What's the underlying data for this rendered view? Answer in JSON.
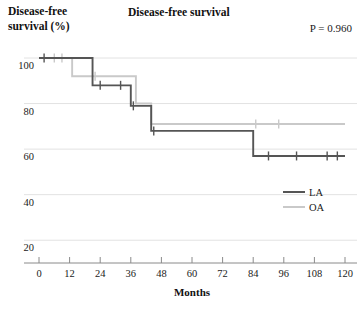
{
  "chart_data": {
    "type": "line",
    "title": "Disease-free survival",
    "subtitle": "",
    "ylabel_line1": "Disease-free",
    "ylabel_line2": "survival (%)",
    "xlabel": "Months",
    "annotation": "P = 0.960",
    "xlim": [
      -4,
      122
    ],
    "ylim": [
      10,
      104
    ],
    "xticks": [
      0,
      12,
      24,
      36,
      48,
      60,
      72,
      84,
      96,
      108,
      120
    ],
    "xtick_labels": [
      "0",
      "12",
      "24",
      "36",
      "48",
      "60",
      "72",
      "84",
      "96",
      "108",
      "120"
    ],
    "yticks": [
      100,
      80,
      60,
      40,
      20
    ],
    "ytick_labels": [
      "100",
      "80",
      "60",
      "40",
      "20"
    ],
    "grid": "horizontal",
    "legend_position": "right-middle",
    "colors": {
      "LA": "#555555",
      "OA": "#c9c9c9",
      "grid": "#e2e2e2",
      "axis": "#8a8a8a",
      "text": "#1a1a1a"
    },
    "series": [
      {
        "name": "LA",
        "label": "LA",
        "color": "#555555",
        "style": "step",
        "steps": [
          {
            "x": 0,
            "y": 100
          },
          {
            "x": 21,
            "y": 100
          },
          {
            "x": 21,
            "y": 88
          },
          {
            "x": 36,
            "y": 88
          },
          {
            "x": 36,
            "y": 79
          },
          {
            "x": 44,
            "y": 79
          },
          {
            "x": 44,
            "y": 68
          },
          {
            "x": 84,
            "y": 68
          },
          {
            "x": 84,
            "y": 57
          },
          {
            "x": 120,
            "y": 57
          }
        ],
        "censored": [
          {
            "x": 2,
            "y": 100
          },
          {
            "x": 24,
            "y": 88
          },
          {
            "x": 32,
            "y": 88
          },
          {
            "x": 37,
            "y": 79
          },
          {
            "x": 45,
            "y": 68
          },
          {
            "x": 90,
            "y": 57
          },
          {
            "x": 101,
            "y": 57
          },
          {
            "x": 113,
            "y": 57
          },
          {
            "x": 117,
            "y": 57
          }
        ]
      },
      {
        "name": "OA",
        "label": "OA",
        "color": "#c9c9c9",
        "style": "step",
        "steps": [
          {
            "x": 0,
            "y": 100
          },
          {
            "x": 13,
            "y": 100
          },
          {
            "x": 13,
            "y": 92
          },
          {
            "x": 38,
            "y": 92
          },
          {
            "x": 38,
            "y": 80
          },
          {
            "x": 44,
            "y": 80
          },
          {
            "x": 44,
            "y": 71
          },
          {
            "x": 120,
            "y": 71
          }
        ],
        "censored": [
          {
            "x": 6,
            "y": 100
          },
          {
            "x": 9,
            "y": 100
          },
          {
            "x": 22,
            "y": 92
          },
          {
            "x": 85,
            "y": 71
          },
          {
            "x": 94,
            "y": 71
          }
        ]
      }
    ]
  },
  "legend": {
    "items": [
      {
        "label": "LA",
        "color": "#555555"
      },
      {
        "label": "OA",
        "color": "#c9c9c9"
      }
    ]
  }
}
